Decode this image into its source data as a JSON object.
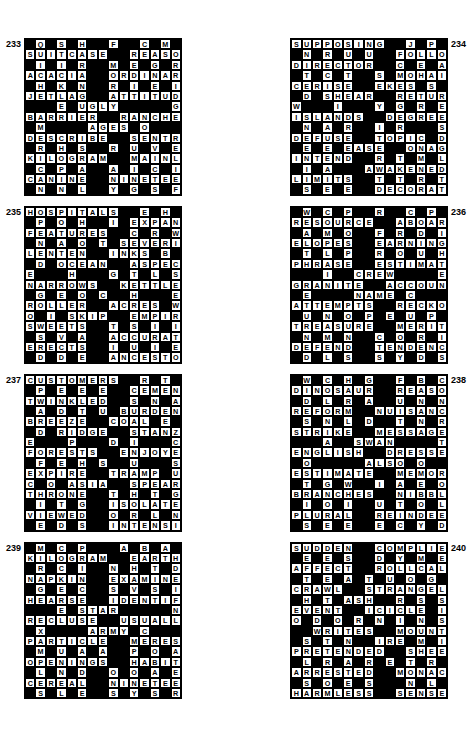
{
  "page": {
    "background": "#ffffff",
    "ink": "#000000"
  },
  "puzzles": [
    {
      "number": "233",
      "number_side": "left",
      "cols": 15,
      "rows": 15,
      "rows_text": [
        ".Q.S.H..F..C.M.P",
        "SUITCASE..REASON",
        ".I.I.R..M.E.G.R.",
        "ACACIA..ORDINARY",
        ".H.K.N..R.I.E.I.",
        "JETLAG..ATTITUDE",
        "...E.UGLY.....G.",
        "BARRIER..RANCHES",
        ".M....AGES.O....",
        "DESCRIBE..SENTRY",
        ".R.H.S..R.U.V.E.",
        "KILOGRAM..MAINLY",
        ".C.P.A..A.I.C.I.",
        "CANINE..NINETEEN",
        ".N.N.L..Y.G.S.F."
      ]
    },
    {
      "number": "234",
      "number_side": "right",
      "cols": 15,
      "rows": 15,
      "rows_text": [
        "SUPPOSING..J.P.A",
        ".N.R.U.U..FOLLOW",
        "DIRECTOR..C.E.A.",
        ".T.C.T..S.MOHAIR",
        "CERISE..EKES.S.E",
        ".D.SHEAR..RETURN",
        "W...I...Y.G.R.E.",
        "ISLANDS..DEGREES",
        ".N.A.R..I.R...S.",
        "DEFUSE..TOPIC.D.",
        ".E.E.EASE..ONAGER",
        "INTEND..R.T.M.L.",
        ".I.A...AWAKENED.",
        "LIMITS..T.T.R.T.",
        ".S.E.E..DECORATED"
      ]
    },
    {
      "number": "235",
      "number_side": "left",
      "cols": 15,
      "rows": 15,
      "rows_text": [
        "HOSPITALS..E.H.A",
        ".P.O.H..I.EXPAND",
        "FEATURES..C.R.W.",
        ".N.A.O.T.SEVERIT",
        "LENTEN..INKS.B.E",
        ".D.OCEAN..ASPECT",
        "E...H...G.T.L.S.",
        "NARROWS..KETTLES",
        ".G.E.O.C..H...E.",
        "ROLLER..ACRES.W.",
        "O.I.SKIP..EMPIRE",
        "SWEETS..T.S.I.I.",
        ".S.V.A..ACCURATE",
        "ERECTS..I.U.I.E.",
        ".D.D.E..ANCESTORS"
      ]
    },
    {
      "number": "236",
      "number_side": "right",
      "cols": 15,
      "rows": 15,
      "rows_text": [
        ".W.C.P..R..C.P.F",
        "RESOURCE..ABOARD",
        ".A.M.O..F.R.D.I.",
        "ELOPES..EARNINGS",
        ".T.L.P..R.O.U.H.",
        "PHRASE..ESTIMATE",
        "...I..CREW....E.",
        "GRANITE..ACCOUNT",
        ".E....NAME.C....",
        "ATTEMPTS..RECKON",
        ".U.N.O.P.E.U.P.",
        "TREASURE..MERITS",
        ".N.M.N..C.O.R.I.",
        "DEFEND..TENDENCY",
        ".D.L.S..S.Y.D.S."
      ]
    },
    {
      "number": "237",
      "number_side": "left",
      "cols": 15,
      "rows": 15,
      "rows_text": [
        "CUSTOMERS..R.T.S",
        ".P.E.E.E..CEMENT",
        "TWINKLED..S.N.A.",
        ".A.D.T.U.BURDEN.",
        "BREEZE..COAL.E.E",
        ".D.RIDGE..STANZA",
        "E...P...D.I...C.",
        "FORESTS..ENJOYED",
        ".F.E.H.S..U...S.",
        "EXPIRE..TRAMP.U.",
        "C.O.ASIA..SPEARS",
        "THRONE..T.H.T.G.",
        ".I.T.G..ISOLATED",
        "VIEWED..O.R.L.N.",
        ".E.D.S..INTENSITY"
      ]
    },
    {
      "number": "238",
      "number_side": "right",
      "cols": 15,
      "rows": 15,
      "rows_text": [
        ".W.C.H.G..F.B.C.",
        "DINOSAUR..REASON",
        ".D.L.R.A..U.N.N.",
        "REFORM..NUISANCE",
        ".S.N.L.D..T.N.R.",
        "STRIKE..MESSAGES",
        "...A..SWAN....T.",
        "ENGLISH..DRESSES",
        ".O.....ALSO.O...",
        "ESTIMATE..MEMORY",
        ".T.G.W..I.A.E.O.",
        "BRANCHES..NIBBLE",
        ".I.O.I..U.T.O.L.",
        "PLURAL..REINDEER",
        ".S.E.E..E.C.Y.D."
      ]
    },
    {
      "number": "239",
      "number_side": "left",
      "cols": 15,
      "rows": 15,
      "rows_text": [
        ".M.C.P...A.B.A.C",
        "KILOGRAM..EARTHY",
        ".R.C.I..N.H.T.D.",
        "NAPKIN..EXAMINED",
        ".G.E.C..S.V.S.I.",
        "HEARSE..IDENTIFY",
        "...E.STAR.....N.",
        "RECLUSE..USUALLY",
        ".X....ARMY.C....",
        "PARTICLE..MEREST",
        ".M.U.A.A..P.O.A.",
        "OPENINGS..HABITS",
        ".L.N.D..O.O.A.E.",
        "CEREAL..NINETEEN",
        ".S.L.E..S.Y.S.R."
      ]
    },
    {
      "number": "240",
      "number_side": "right",
      "cols": 15,
      "rows": 15,
      "rows_text": [
        "SUDDEN..COMPLIED",
        ".E.E.S..D.Y.M.E.",
        "AFFECT..ROLLCALL",
        ".T.E.A.T.U.O.G.A",
        "CRAWL..STRANGELY",
        ".H.T.ASH..R.S.S.",
        "EVENT..ICICLE.I.",
        "O.D.O.R.N.I.N.S.",
        "..WRITES..MOUNTS",
        ".S.T.N..IRE.M.I.",
        "PRETENDED..SHEET",
        ".L.R.A.R.E.T.R.E",
        "ARRESTED..MONACO",
        ".S.O.E.S...N.L.D",
        "HARMLESS..SENSES"
      ]
    }
  ]
}
